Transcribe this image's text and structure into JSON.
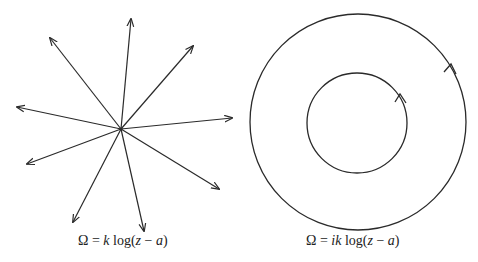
{
  "left": {
    "caption_parts": [
      "Ω = ",
      "k",
      " log(",
      "z",
      " − ",
      "a",
      ")"
    ],
    "center": [
      121,
      129
    ],
    "arrow_tips": [
      [
        131,
        19
      ],
      [
        193,
        46
      ],
      [
        232,
        118
      ],
      [
        219,
        189
      ],
      [
        144,
        231
      ],
      [
        73,
        222
      ],
      [
        27,
        164
      ],
      [
        17,
        107
      ],
      [
        50,
        38
      ]
    ]
  },
  "right": {
    "caption_parts": [
      "Ω = ",
      "ik",
      " log(",
      "z",
      " − ",
      "a",
      ")"
    ],
    "center": [
      358,
      122
    ],
    "outer_radius": 108,
    "inner_radius": 50,
    "direction": "counterclockwise"
  },
  "colors": {
    "stroke": "#2a2a2a"
  }
}
